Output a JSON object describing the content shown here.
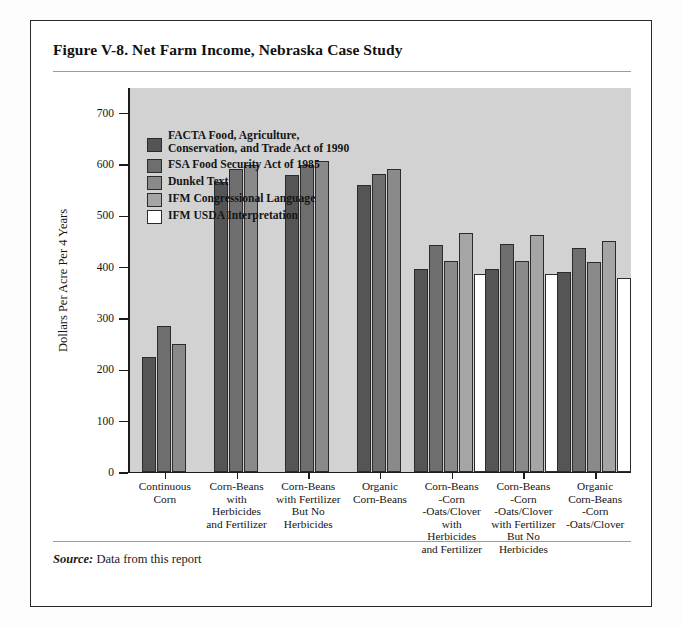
{
  "figure": {
    "title": "Figure V-8.  Net Farm Income, Nebraska Case Study",
    "source_label": "Source:",
    "source_text": " Data from this report"
  },
  "chart_data": {
    "type": "bar",
    "title": "Net Farm Income, Nebraska Case Study",
    "xlabel": "",
    "ylabel": "Dollars Per Acre Per 4 Years",
    "ylim": [
      0,
      750
    ],
    "yticks": [
      0,
      100,
      200,
      300,
      400,
      500,
      600,
      700
    ],
    "ytick_labels": [
      "0",
      "100",
      "200",
      "300",
      "400",
      "500",
      "600",
      "700"
    ],
    "grid": false,
    "legend_position": "upper-left-inside",
    "categories": [
      "Continuous\nCorn",
      "Corn-Beans\nwith\nHerbicides\nand Fertilizer",
      "Corn-Beans\nwith Fertilizer\nBut No\nHerbicides",
      "Organic\nCorn-Beans",
      "Corn-Beans\n-Corn\n-Oats/Clover\nwith\nHerbicides\nand Fertilizer",
      "Corn-Beans\n-Corn\n-Oats/Clover\nwith Fertilizer\nBut No\nHerbicides",
      "Organic\nCorn-Beans\n-Corn\n-Oats/Clover"
    ],
    "series": [
      {
        "name": "FACTA  Food, Agriculture, Conservation, and Trade Act of 1990",
        "short": "FACTA",
        "color": "#555555",
        "values": [
          225,
          565,
          578,
          560,
          395,
          395,
          390
        ]
      },
      {
        "name": "FSA  Food Security Act of 1985",
        "short": "FSA",
        "color": "#6e6e6e",
        "values": [
          285,
          590,
          598,
          580,
          443,
          445,
          437
        ]
      },
      {
        "name": "Dunkel Text",
        "short": "Dunkel",
        "color": "#8a8a8a",
        "values": [
          250,
          598,
          605,
          590,
          412,
          412,
          410
        ]
      },
      {
        "name": "IFM  Congressional Language",
        "short": "IFM Congressional",
        "color": "#a5a5a5",
        "values": [
          null,
          null,
          null,
          null,
          465,
          462,
          450
        ]
      },
      {
        "name": "IFM  USDA Interpretation",
        "short": "IFM USDA",
        "color": "#ffffff",
        "values": [
          null,
          null,
          null,
          null,
          385,
          385,
          377
        ]
      }
    ]
  },
  "legend": [
    {
      "label_line1": "FACTA  Food, Agriculture,",
      "label_line2": "Conservation, and Trade Act of 1990",
      "color": "#555555"
    },
    {
      "label_line1": "FSA  Food Security Act of 1985",
      "label_line2": "",
      "color": "#6e6e6e"
    },
    {
      "label_line1": "Dunkel Text",
      "label_line2": "",
      "color": "#8a8a8a"
    },
    {
      "label_line1": "IFM  Congressional Language",
      "label_line2": "",
      "color": "#a5a5a5"
    },
    {
      "label_line1": "IFM  USDA Interpretation",
      "label_line2": "",
      "color": "#ffffff"
    }
  ]
}
